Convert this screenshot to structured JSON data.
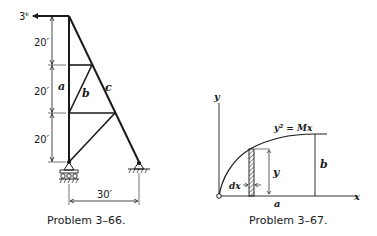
{
  "problem_66": {
    "caption": "Problem 3–66.",
    "load_label": "3ᵏ",
    "member_labels": {
      "a": "a",
      "b": "b",
      "c": "c"
    },
    "panel_heights": [
      "20′",
      "20′",
      "20′"
    ],
    "span": "30′",
    "supports": [
      "roller-support",
      "pin-support"
    ]
  },
  "problem_67": {
    "caption": "Problem 3–67.",
    "equation": "y² = Mx",
    "x_axis_label": "x",
    "y_axis_label": "y",
    "width_label": "a",
    "height_label": "b",
    "strip_height_label": "y",
    "strip_width_label": "dx"
  }
}
